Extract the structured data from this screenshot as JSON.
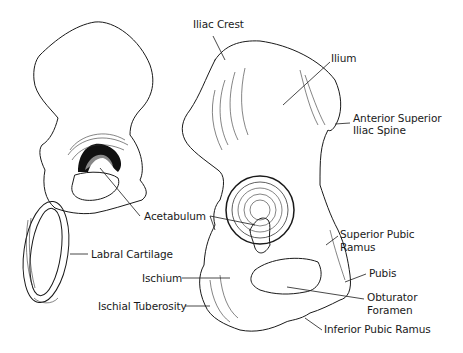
{
  "figure": {
    "labels": [
      {
        "id": "iliac-crest",
        "text": "Iliac Crest",
        "x": 193,
        "y": 24
      },
      {
        "id": "ilium",
        "text": "Ilium",
        "x": 331,
        "y": 51
      },
      {
        "id": "asis-1",
        "text": "Anterior Superior",
        "x": 353,
        "y": 112
      },
      {
        "id": "asis-2",
        "text": "Iliac Spine",
        "x": 353,
        "y": 124
      },
      {
        "id": "acetabulum",
        "text": "Acetabulum",
        "x": 144,
        "y": 210
      },
      {
        "id": "superior-pubic-ramus-1",
        "text": "Superior Pubic",
        "x": 340,
        "y": 228
      },
      {
        "id": "superior-pubic-ramus-2",
        "text": "Ramus",
        "x": 340,
        "y": 241
      },
      {
        "id": "labral-cartilage",
        "text": "Labral Cartilage",
        "x": 91,
        "y": 248
      },
      {
        "id": "ischium",
        "text": "Ischium",
        "x": 142,
        "y": 270
      },
      {
        "id": "pubis",
        "text": "Pubis",
        "x": 369,
        "y": 267
      },
      {
        "id": "obturator-foramen-1",
        "text": "Obturator",
        "x": 367,
        "y": 290
      },
      {
        "id": "obturator-foramen-2",
        "text": "Foramen",
        "x": 367,
        "y": 303
      },
      {
        "id": "ischial-tuberosity",
        "text": "Ischial Tuberosity",
        "x": 98,
        "y": 298
      },
      {
        "id": "inferior-pubic-ramus",
        "text": "Inferior Pubic Ramus",
        "x": 324,
        "y": 323
      }
    ],
    "signature": "Nick Lang"
  }
}
